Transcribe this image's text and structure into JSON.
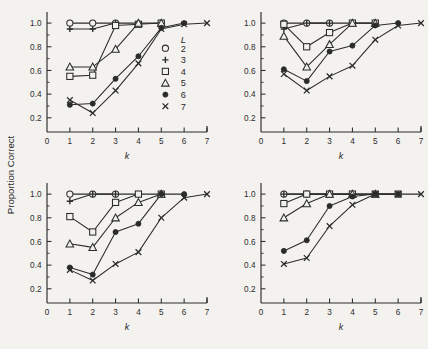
{
  "figure": {
    "background_color": "#f3f2ef",
    "ink_color": "#2b2b2b",
    "ylabel": "Proportion Correct",
    "xlabel": "k",
    "panels_rows": 2,
    "panels_cols": 2
  },
  "axes": {
    "x_ticks": [
      "0",
      "1",
      "2",
      "3",
      "4",
      "5",
      "6",
      "7"
    ],
    "y_ticks": [
      "0.2",
      "0.4",
      "0.6",
      "0.8",
      "1.0"
    ],
    "x_min": 0,
    "x_max": 7,
    "y_min": 0.08,
    "y_max": 1.06
  },
  "legend": {
    "title": "L",
    "entries": [
      {
        "label": "2",
        "marker": "open-circle"
      },
      {
        "label": "3",
        "marker": "plus"
      },
      {
        "label": "4",
        "marker": "open-square"
      },
      {
        "label": "5",
        "marker": "open-triangle"
      },
      {
        "label": "6",
        "marker": "filled-circle"
      },
      {
        "label": "7",
        "marker": "cross"
      }
    ]
  },
  "chart_data": [
    {
      "type": "line",
      "panel": "top-left",
      "title": "",
      "xlabel": "k",
      "ylabel": "Proportion Correct",
      "xlim": [
        0,
        7
      ],
      "ylim": [
        0.08,
        1.06
      ],
      "x": [
        1,
        2,
        3,
        4,
        5,
        6,
        7
      ],
      "grid": false,
      "legend_position": "inside-right",
      "series": [
        {
          "name": "L = 2",
          "marker": "open-circle",
          "x": [
            1,
            2,
            3
          ],
          "values": [
            1.0,
            1.0,
            1.0
          ]
        },
        {
          "name": "L = 3",
          "marker": "plus",
          "x": [
            1,
            2,
            3,
            4
          ],
          "values": [
            0.95,
            0.95,
            1.0,
            1.0
          ]
        },
        {
          "name": "L = 4",
          "marker": "open-square",
          "x": [
            1,
            2,
            3,
            4,
            5
          ],
          "values": [
            0.55,
            0.56,
            0.98,
            0.99,
            1.0
          ]
        },
        {
          "name": "L = 5",
          "marker": "open-triangle",
          "x": [
            1,
            2,
            3,
            4,
            5
          ],
          "values": [
            0.63,
            0.63,
            0.78,
            1.0,
            1.0
          ]
        },
        {
          "name": "L = 6",
          "marker": "filled-circle",
          "x": [
            1,
            2,
            3,
            4,
            5,
            6
          ],
          "values": [
            0.31,
            0.32,
            0.53,
            0.72,
            0.96,
            1.0
          ]
        },
        {
          "name": "L = 7",
          "marker": "cross",
          "x": [
            1,
            2,
            3,
            4,
            5,
            6,
            7
          ],
          "values": [
            0.35,
            0.24,
            0.43,
            0.66,
            0.95,
            0.99,
            1.0
          ]
        }
      ]
    },
    {
      "type": "line",
      "panel": "top-right",
      "title": "",
      "xlabel": "k",
      "ylabel": "Proportion Correct",
      "xlim": [
        0,
        7
      ],
      "ylim": [
        0.08,
        1.06
      ],
      "x": [
        1,
        2,
        3,
        4,
        5,
        6,
        7
      ],
      "grid": false,
      "legend_position": "none",
      "series": [
        {
          "name": "L = 2",
          "marker": "open-circle",
          "x": [
            1,
            2,
            3
          ],
          "values": [
            1.0,
            1.0,
            1.0
          ]
        },
        {
          "name": "L = 3",
          "marker": "plus",
          "x": [
            1,
            2,
            3,
            4
          ],
          "values": [
            0.95,
            1.0,
            1.0,
            1.0
          ]
        },
        {
          "name": "L = 4",
          "marker": "open-square",
          "x": [
            1,
            2,
            3,
            4,
            5
          ],
          "values": [
            0.99,
            0.8,
            0.92,
            1.0,
            1.0
          ]
        },
        {
          "name": "L = 5",
          "marker": "open-triangle",
          "x": [
            1,
            2,
            3,
            4,
            5
          ],
          "values": [
            0.89,
            0.63,
            0.82,
            1.0,
            1.0
          ]
        },
        {
          "name": "L = 6",
          "marker": "filled-circle",
          "x": [
            1,
            2,
            3,
            4,
            5,
            6
          ],
          "values": [
            0.61,
            0.51,
            0.76,
            0.81,
            0.98,
            1.0
          ]
        },
        {
          "name": "L = 7",
          "marker": "cross",
          "x": [
            1,
            2,
            3,
            4,
            5,
            6,
            7
          ],
          "values": [
            0.57,
            0.43,
            0.55,
            0.64,
            0.86,
            0.98,
            1.0
          ]
        }
      ]
    },
    {
      "type": "line",
      "panel": "bottom-left",
      "title": "",
      "xlabel": "k",
      "ylabel": "Proportion Correct",
      "xlim": [
        0,
        7
      ],
      "ylim": [
        0.08,
        1.06
      ],
      "x": [
        1,
        2,
        3,
        4,
        5,
        6,
        7
      ],
      "grid": false,
      "legend_position": "none",
      "series": [
        {
          "name": "L = 2",
          "marker": "open-circle",
          "x": [
            1,
            2,
            3
          ],
          "values": [
            1.0,
            1.0,
            1.0
          ]
        },
        {
          "name": "L = 3",
          "marker": "plus",
          "x": [
            1,
            2,
            3,
            4
          ],
          "values": [
            0.94,
            1.0,
            1.0,
            1.0
          ]
        },
        {
          "name": "L = 4",
          "marker": "open-square",
          "x": [
            1,
            2,
            3,
            4,
            5
          ],
          "values": [
            0.81,
            0.68,
            0.93,
            1.0,
            1.0
          ]
        },
        {
          "name": "L = 5",
          "marker": "open-triangle",
          "x": [
            1,
            2,
            3,
            4,
            5
          ],
          "values": [
            0.58,
            0.55,
            0.8,
            0.93,
            1.0
          ]
        },
        {
          "name": "L = 6",
          "marker": "filled-circle",
          "x": [
            1,
            2,
            3,
            4,
            5,
            6
          ],
          "values": [
            0.38,
            0.32,
            0.68,
            0.75,
            1.0,
            1.0
          ]
        },
        {
          "name": "L = 7",
          "marker": "cross",
          "x": [
            1,
            2,
            3,
            4,
            5,
            6,
            7
          ],
          "values": [
            0.36,
            0.27,
            0.41,
            0.51,
            0.8,
            0.97,
            1.0
          ]
        }
      ]
    },
    {
      "type": "line",
      "panel": "bottom-right",
      "title": "",
      "xlabel": "k",
      "ylabel": "Proportion Correct",
      "xlim": [
        0,
        7
      ],
      "ylim": [
        0.08,
        1.06
      ],
      "x": [
        1,
        2,
        3,
        4,
        5,
        6,
        7
      ],
      "grid": false,
      "legend_position": "none",
      "series": [
        {
          "name": "L = 2",
          "marker": "open-circle",
          "x": [
            1,
            2,
            3
          ],
          "values": [
            1.0,
            1.0,
            1.0
          ]
        },
        {
          "name": "L = 3",
          "marker": "plus",
          "x": [
            1,
            2,
            3,
            4
          ],
          "values": [
            1.0,
            1.0,
            1.0,
            1.0
          ]
        },
        {
          "name": "L = 4",
          "marker": "open-square",
          "x": [
            1,
            2,
            3,
            4,
            5,
            6
          ],
          "values": [
            0.92,
            1.0,
            1.0,
            1.0,
            1.0,
            1.0
          ]
        },
        {
          "name": "L = 5",
          "marker": "open-triangle",
          "x": [
            1,
            2,
            3,
            4,
            5
          ],
          "values": [
            0.8,
            0.92,
            1.0,
            1.0,
            1.0
          ]
        },
        {
          "name": "L = 6",
          "marker": "filled-circle",
          "x": [
            1,
            2,
            3,
            4,
            5,
            6
          ],
          "values": [
            0.52,
            0.61,
            0.9,
            0.98,
            1.0,
            1.0
          ]
        },
        {
          "name": "L = 7",
          "marker": "cross",
          "x": [
            1,
            2,
            3,
            4,
            5,
            6,
            7
          ],
          "values": [
            0.41,
            0.46,
            0.73,
            0.91,
            1.0,
            1.0,
            1.0
          ]
        }
      ]
    }
  ]
}
